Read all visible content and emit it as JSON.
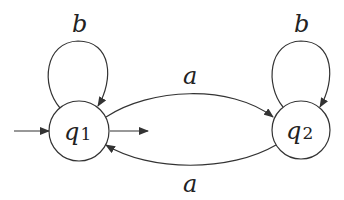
{
  "diagram": {
    "type": "finite-automaton",
    "colors": {
      "stroke": "#333333",
      "text": "#222222",
      "background": "#ffffff"
    },
    "states": [
      {
        "id": "q1",
        "label": "q",
        "subscript": "1",
        "initial": true,
        "final": true
      },
      {
        "id": "q2",
        "label": "q",
        "subscript": "2",
        "initial": false,
        "final": false
      }
    ],
    "transitions": [
      {
        "from": "q1",
        "to": "q1",
        "label": "b"
      },
      {
        "from": "q2",
        "to": "q2",
        "label": "b"
      },
      {
        "from": "q1",
        "to": "q2",
        "label": "a"
      },
      {
        "from": "q2",
        "to": "q1",
        "label": "a"
      }
    ]
  }
}
